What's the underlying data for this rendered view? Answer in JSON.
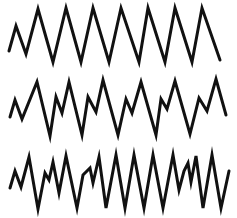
{
  "diagram": {
    "background": "#ffffff",
    "stroke_color": "#111111",
    "stroke_width": 3,
    "waveforms": [
      {
        "name": "waveform-regular",
        "description": "Regular sawtooth-like oscillation with uniform peaks",
        "points": [
          [
            9,
            51
          ],
          [
            16,
            26
          ],
          [
            26,
            54
          ],
          [
            38,
            9
          ],
          [
            53,
            62
          ],
          [
            66,
            8
          ],
          [
            81,
            62
          ],
          [
            93,
            8
          ],
          [
            109,
            62
          ],
          [
            121,
            8
          ],
          [
            139,
            62
          ],
          [
            148,
            8
          ],
          [
            165,
            62
          ],
          [
            175,
            8
          ],
          [
            192,
            62
          ],
          [
            202,
            8
          ],
          [
            220,
            60
          ]
        ]
      },
      {
        "name": "waveform-notched",
        "description": "Oscillation with a secondary notch on each rising edge",
        "points": [
          [
            10,
            117
          ],
          [
            15,
            100
          ],
          [
            22,
            119
          ],
          [
            37,
            82
          ],
          [
            50,
            136
          ],
          [
            56,
            97
          ],
          [
            62,
            113
          ],
          [
            69,
            82
          ],
          [
            82,
            135
          ],
          [
            88,
            97
          ],
          [
            96,
            112
          ],
          [
            103,
            80
          ],
          [
            118,
            135
          ],
          [
            126,
            99
          ],
          [
            132,
            113
          ],
          [
            141,
            82
          ],
          [
            156,
            135
          ],
          [
            161,
            99
          ],
          [
            167,
            109
          ],
          [
            175,
            81
          ],
          [
            190,
            134
          ],
          [
            199,
            98
          ],
          [
            207,
            111
          ],
          [
            216,
            79
          ],
          [
            226,
            115
          ]
        ]
      },
      {
        "name": "waveform-irregular",
        "description": "Higher-frequency oscillation with irregular notches",
        "points": [
          [
            10,
            188
          ],
          [
            15,
            171
          ],
          [
            21,
            187
          ],
          [
            29,
            157
          ],
          [
            38,
            209
          ],
          [
            45,
            173
          ],
          [
            49,
            180
          ],
          [
            53,
            162
          ],
          [
            59,
            193
          ],
          [
            66,
            156
          ],
          [
            77,
            208
          ],
          [
            83,
            175
          ],
          [
            90,
            168
          ],
          [
            93,
            183
          ],
          [
            99,
            157
          ],
          [
            106,
            208
          ],
          [
            116,
            155
          ],
          [
            125,
            208
          ],
          [
            134,
            155
          ],
          [
            144,
            208
          ],
          [
            153,
            155
          ],
          [
            163,
            208
          ],
          [
            173,
            155
          ],
          [
            179,
            190
          ],
          [
            184,
            171
          ],
          [
            188,
            163
          ],
          [
            191,
            182
          ],
          [
            196,
            156
          ],
          [
            203,
            208
          ],
          [
            212,
            155
          ],
          [
            221,
            208
          ],
          [
            229,
            171
          ]
        ]
      }
    ]
  }
}
